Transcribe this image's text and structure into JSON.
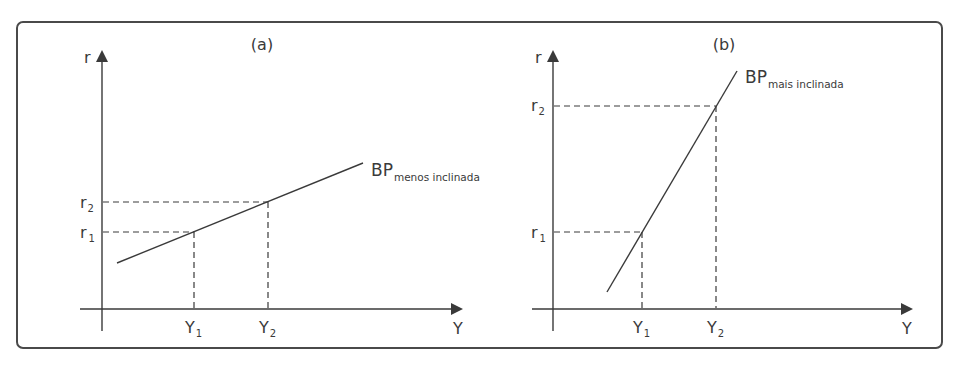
{
  "figure": {
    "panels": [
      {
        "id": "a",
        "title": "(a)",
        "y_axis_label": "r",
        "x_axis_label": "Y",
        "curve_label_main": "BP",
        "curve_label_sub": "menos inclinada",
        "r_ticks": [
          {
            "main": "r",
            "sub": "1"
          },
          {
            "main": "r",
            "sub": "2"
          }
        ],
        "y_ticks": [
          {
            "main": "Y",
            "sub": "1"
          },
          {
            "main": "Y",
            "sub": "2"
          }
        ]
      },
      {
        "id": "b",
        "title": "(b)",
        "y_axis_label": "r",
        "x_axis_label": "Y",
        "curve_label_main": "BP",
        "curve_label_sub": "mais inclinada",
        "r_ticks": [
          {
            "main": "r",
            "sub": "1"
          },
          {
            "main": "r",
            "sub": "2"
          }
        ],
        "y_ticks": [
          {
            "main": "Y",
            "sub": "1"
          },
          {
            "main": "Y",
            "sub": "2"
          }
        ]
      }
    ]
  },
  "colors": {
    "ink": "#3a3a3a",
    "frame": "#4a4a4a",
    "background": "#ffffff"
  }
}
